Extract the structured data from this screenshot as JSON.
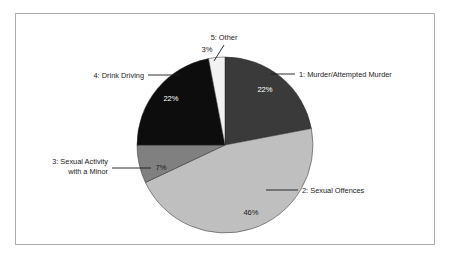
{
  "chart_data": {
    "type": "pie",
    "title": "",
    "subtitle": "",
    "xlabel": "",
    "ylabel": "",
    "legend_position": "callout-labels",
    "grid": false,
    "start_angle_deg": 0,
    "direction": "clockwise",
    "categories": [
      "1: Murder/Attempted Murder",
      "2: Sexual Offences",
      "3: Sexual Activity with a Minor",
      "4: Drink Driving",
      "5: Other"
    ],
    "values": [
      22,
      46,
      7,
      22,
      3
    ],
    "value_labels": [
      "22%",
      "46%",
      "7%",
      "22%",
      "3%"
    ],
    "colors": [
      "#3a3a3a",
      "#bfbfbf",
      "#808080",
      "#0d0d0d",
      "#f2f2f2"
    ]
  },
  "chart": {
    "slices": [
      {
        "index": 1,
        "key": "murder",
        "label": "1: Murder/Attempted Murder",
        "label_line1": "1: Murder/Attempted Murder",
        "label_line2": "",
        "value": 22,
        "percent_label": "22%",
        "color": "#3a3a3a",
        "percent_text_color": "#ffffff"
      },
      {
        "index": 2,
        "key": "sexual-offences",
        "label": "2: Sexual Offences",
        "label_line1": "2: Sexual Offences",
        "label_line2": "",
        "value": 46,
        "percent_label": "46%",
        "color": "#bfbfbf",
        "percent_text_color": "#1a1a1a"
      },
      {
        "index": 3,
        "key": "sexual-activity-minor",
        "label": "3: Sexual Activity with a Minor",
        "label_line1": "3: Sexual Activity",
        "label_line2": "with a Minor",
        "value": 7,
        "percent_label": "7%",
        "color": "#808080",
        "percent_text_color": "#1a1a1a"
      },
      {
        "index": 4,
        "key": "drink-driving",
        "label": "4: Drink Driving",
        "label_line1": "4: Drink Driving",
        "label_line2": "",
        "value": 22,
        "percent_label": "22%",
        "color": "#0d0d0d",
        "percent_text_color": "#ffffff"
      },
      {
        "index": 5,
        "key": "other",
        "label": "5: Other",
        "label_line1": "5: Other",
        "label_line2": "",
        "value": 3,
        "percent_label": "3%",
        "color": "#f2f2f2",
        "percent_text_color": "#1a1a1a"
      }
    ]
  }
}
